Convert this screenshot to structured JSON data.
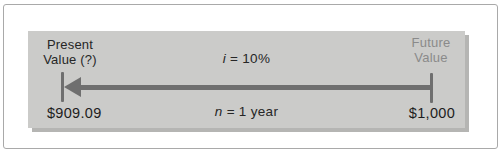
{
  "figure": {
    "labels": {
      "present": {
        "line1": "Present",
        "line2": "Value (?)"
      },
      "future": {
        "line1": "Future",
        "line2": "Value"
      }
    },
    "rate": {
      "symbol": "i",
      "value": "= 10%"
    },
    "period": {
      "symbol": "n",
      "value": "= 1 year"
    },
    "amounts": {
      "present": "$909.09",
      "future": "$1,000"
    },
    "colors": {
      "panel_bg": "#cbcbc9",
      "panel_shadow": "#b5b5b3",
      "frame_border": "#a9a9a9",
      "arrow": "#6f6f6f",
      "text_dark": "#262626",
      "text_muted": "#8a8a8a"
    },
    "icons": {
      "arrowhead": "left-arrowhead-icon",
      "ticks": "timeline-tick-mark"
    }
  }
}
